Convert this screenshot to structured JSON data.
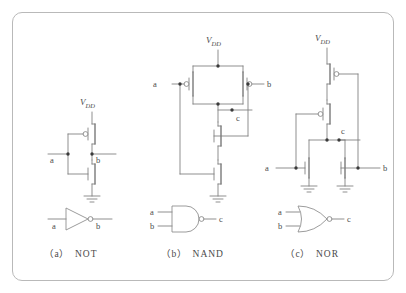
{
  "figure": {
    "kind": "cmos-logic-gate-schematics",
    "border_color": "#b9b9b9",
    "wire_color": "#7c7c7c",
    "text_color": "#4a4a4a"
  },
  "panels": [
    {
      "id": "not",
      "caption_index": "（a）",
      "caption_name": "NOT",
      "supply_label": "V",
      "supply_sub": "DD",
      "ground_count": 1,
      "inputs": [
        "a"
      ],
      "output": "b",
      "pmos_count": 1,
      "nmos_count": 1,
      "pmos_arrangement": "single",
      "nmos_arrangement": "single",
      "symbol": "inverter-triangle-with-bubble"
    },
    {
      "id": "nand",
      "caption_index": "（b）",
      "caption_name": "NAND",
      "supply_label": "V",
      "supply_sub": "DD",
      "ground_count": 1,
      "inputs": [
        "a",
        "b"
      ],
      "output": "c",
      "pmos_count": 2,
      "nmos_count": 2,
      "pmos_arrangement": "parallel",
      "nmos_arrangement": "series",
      "symbol": "and-d-shape-with-bubble"
    },
    {
      "id": "nor",
      "caption_index": "（c）",
      "caption_name": "NOR",
      "supply_label": "V",
      "supply_sub": "DD",
      "ground_count": 2,
      "inputs": [
        "a",
        "b"
      ],
      "output": "b",
      "node_label": "c",
      "pmos_count": 2,
      "nmos_count": 2,
      "pmos_arrangement": "series",
      "nmos_arrangement": "parallel",
      "symbol": "or-curved-shape-with-bubble"
    }
  ],
  "symbol_labels": {
    "not_in": "a",
    "not_out": "b",
    "nand_in1": "a",
    "nand_in2": "b",
    "nand_out": "c",
    "nor_in1": "a",
    "nor_in2": "b",
    "nor_out": "c"
  }
}
